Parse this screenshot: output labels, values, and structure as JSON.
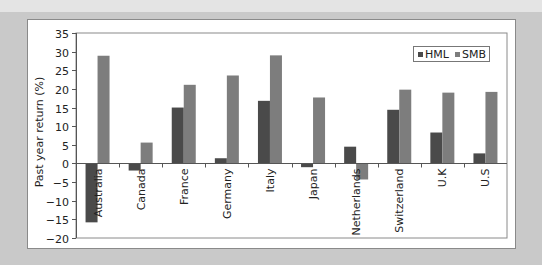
{
  "colors": {
    "hml": "#4a4a4a",
    "smb": "#7d7d7d",
    "background": "#c9c9c9",
    "panel": "#ffffff",
    "axis": "#555555"
  },
  "chart_data": {
    "type": "bar",
    "title": "",
    "xlabel": "",
    "ylabel": "Past year return (%)",
    "ylim": [
      -20,
      35
    ],
    "yticks": [
      35,
      30,
      25,
      20,
      15,
      10,
      5,
      0,
      -5,
      -10,
      -15,
      -20
    ],
    "ytick_labels": [
      "35",
      "30",
      "25",
      "20",
      "15",
      "10",
      "5",
      "0",
      "−15",
      "−10",
      "−15",
      "−20"
    ],
    "grid": false,
    "legend_position": "top-right",
    "categories": [
      "Australia",
      "Canada",
      "France",
      "Germany",
      "Italy",
      "Japan",
      "Netherlands",
      "Switzerland",
      "U.K",
      "U.S"
    ],
    "series": [
      {
        "name": "HML",
        "values": [
          -15.8,
          -1.9,
          15.0,
          1.4,
          16.8,
          -1.0,
          4.5,
          14.4,
          8.3,
          2.7
        ]
      },
      {
        "name": "SMB",
        "values": [
          28.9,
          5.6,
          21.1,
          23.6,
          29.0,
          17.7,
          -4.3,
          19.8,
          19.0,
          19.2
        ]
      }
    ]
  }
}
